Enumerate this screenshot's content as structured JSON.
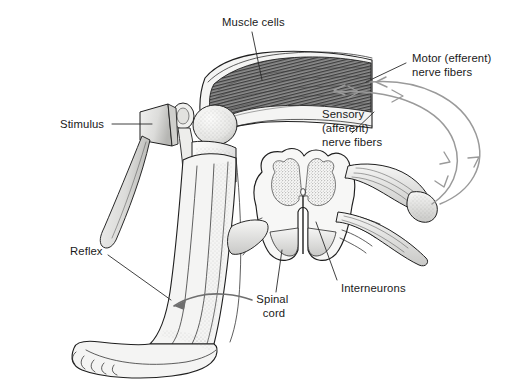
{
  "figure": {
    "width": 518,
    "height": 392,
    "background_color": "#ffffff",
    "style": "grayscale pen-and-ink anatomical line drawing with stippled shading"
  },
  "labels": {
    "muscle_cells": {
      "lines": [
        "Muscle cells"
      ],
      "line1": "Muscle cells",
      "x": 222,
      "y": 26,
      "anchor": "start",
      "points_to": "striated quadriceps muscle fibers"
    },
    "stimulus": {
      "lines": [
        "Stimulus"
      ],
      "line1": "Stimulus",
      "x": 60,
      "y": 128,
      "anchor": "start",
      "points_to": "reflex hammer striking the patellar tendon"
    },
    "motor_nerve_fibers": {
      "lines": [
        "Motor (efferent)",
        "nerve fibers"
      ],
      "line1": "Motor (efferent)",
      "line2": "nerve fibers",
      "x": 412,
      "y": 62,
      "anchor": "start",
      "points_to": "outer gray nerve loop running from spinal cord to muscle"
    },
    "sensory_nerve_fibers": {
      "lines": [
        "Sensory",
        "(afferent)",
        "nerve fibers"
      ],
      "line1": "Sensory",
      "line2": "(afferent)",
      "line3": "nerve fibers",
      "x": 322,
      "y": 118,
      "anchor": "start",
      "points_to": "inner gray nerve loop running from muscle to spinal cord"
    },
    "reflex": {
      "lines": [
        "Reflex"
      ],
      "line1": "Reflex",
      "x": 70,
      "y": 255,
      "anchor": "start",
      "points_to": "curved arrow at the ankle showing leg kick response"
    },
    "spinal_cord": {
      "lines": [
        "Spinal",
        "cord"
      ],
      "line1": "Spinal",
      "line2": "cord",
      "x": 274,
      "y": 303,
      "anchor": "middle",
      "points_to": "spinal cord cross-section"
    },
    "interneurons": {
      "lines": [
        "Interneurons"
      ],
      "line1": "Interneurons",
      "x": 341,
      "y": 292,
      "anchor": "start",
      "points_to": "gray matter of the spinal cord between dorsal and ventral horns"
    }
  },
  "colors": {
    "ink": "#1f1f1f",
    "label_text": "#1a1a1a",
    "leader_line": "#2b2b2b",
    "nerve_fiber": "#9a9a9a",
    "reflex_arrow": "#6f6f6f",
    "tissue_fill": "#f4f4f3",
    "muscle_shade": "#6b6b6b",
    "gray_matter": "#d8d8d6",
    "background": "#ffffff"
  },
  "anatomy": {
    "parts": [
      "thigh with quadriceps muscle cells",
      "knee joint with patella and femoral condyle",
      "lower leg (tibia and calf)",
      "foot and toes",
      "reflex hammer",
      "spinal cord cross-section with butterfly gray matter",
      "dorsal and ventral nerve roots",
      "peripheral nerve trunk"
    ]
  }
}
